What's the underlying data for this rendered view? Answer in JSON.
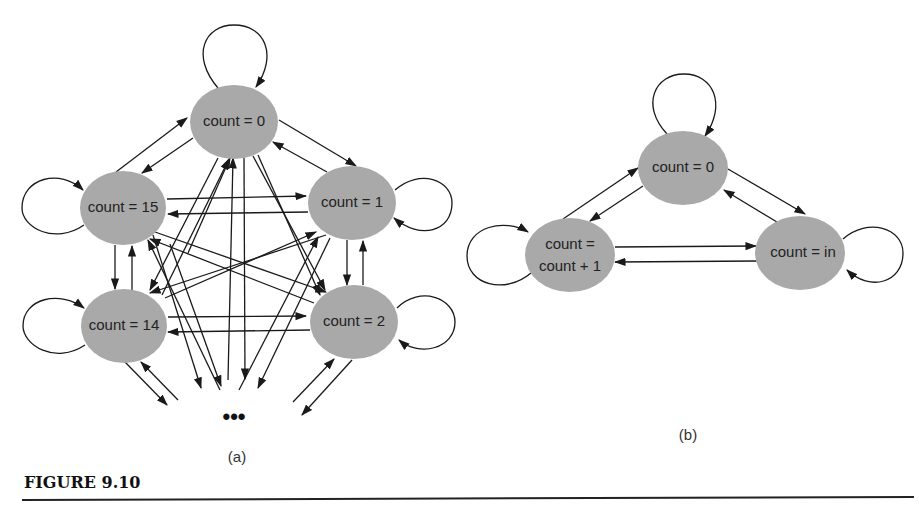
{
  "figure": {
    "caption": "FIGURE 9.10",
    "subfigure_a": {
      "label": "(a)",
      "nodes": {
        "n0": "count = 0",
        "n1": "count = 1",
        "n2": "count = 2",
        "n14": "count = 14",
        "n15": "count = 15"
      },
      "ellipsis": "•••"
    },
    "subfigure_b": {
      "label": "(b)",
      "nodes": {
        "zero": "count = 0",
        "inc_line1": "count =",
        "inc_line2": "count + 1",
        "load": "count = in"
      }
    }
  },
  "colors": {
    "node_fill": "#a9a9a9",
    "edge": "#1a1a1a"
  }
}
